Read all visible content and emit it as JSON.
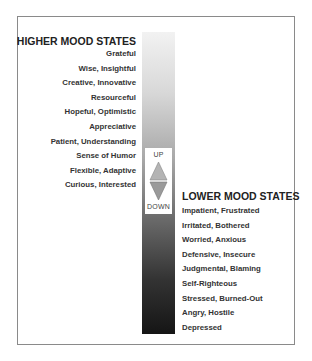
{
  "diagram": {
    "type": "mood-scale",
    "higher": {
      "title": "HIGHER MOOD STATES",
      "items": [
        "Grateful",
        "Wise, Insightful",
        "Creative, Innovative",
        "Resourceful",
        "Hopeful, Optimistic",
        "Appreciative",
        "Patient, Understanding",
        "Sense of Humor",
        "Flexible, Adaptive",
        "Curious, Interested"
      ]
    },
    "lower": {
      "title": "LOWER MOOD STATES",
      "items": [
        "Impatient, Frustrated",
        "Irritated, Bothered",
        "Worried, Anxious",
        "Defensive, Insecure",
        "Judgmental, Blaming",
        "Self-Righteous",
        "Stressed, Burned-Out",
        "Angry, Hostile",
        "Depressed"
      ]
    },
    "scale": {
      "up_label": "UP",
      "down_label": "DOWN",
      "gradient_top_color": "#f2f2f2",
      "gradient_bottom_color": "#151515",
      "arrow_color": "#a8a8a8"
    }
  }
}
